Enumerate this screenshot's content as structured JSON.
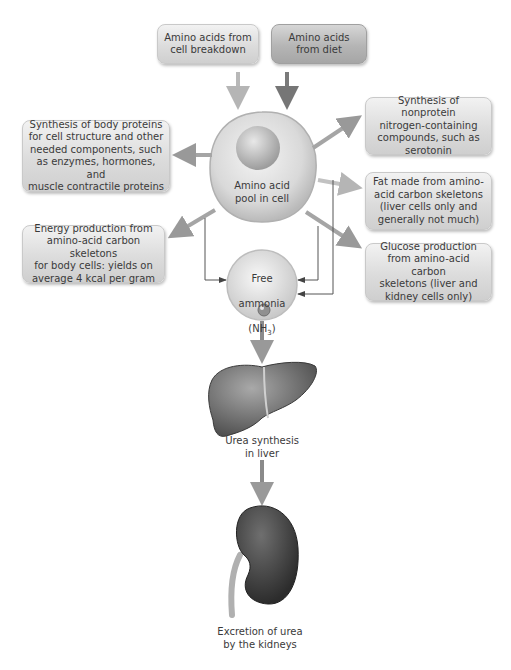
{
  "inputs": [
    {
      "id": "cell-breakdown",
      "text": "Amino acids from\ncell breakdown"
    },
    {
      "id": "diet",
      "text": "Amino acids\nfrom diet"
    }
  ],
  "center": {
    "text": "Amino acid\npool in cell"
  },
  "outputs": {
    "body_proteins": "Synthesis of body proteins\nfor cell structure and other\nneeded components, such\nas enzymes, hormones, and\nmuscle contractile proteins",
    "energy": "Energy production from\namino-acid carbon skeletons\nfor body cells: yields on\naverage 4 kcal per gram",
    "nonprotein": "Synthesis of nonprotein\nnitrogen-containing\ncompounds, such as\nserotonin",
    "fat": "Fat made from amino-\nacid carbon skeletons\n(liver cells only and\ngenerally not much)",
    "glucose": "Glucose production\nfrom amino-acid carbon\nskeletons (liver and\nkidney cells only)"
  },
  "ammonia": {
    "line1": "Free",
    "line2": "ammonia",
    "line3": "(NH",
    "subscript": "3",
    "line3_end": ")"
  },
  "liver": {
    "label": "Urea synthesis\nin liver"
  },
  "kidney": {
    "label": "Excretion of urea\nby the kidneys"
  },
  "colors": {
    "arrow_light": "#b8b8b8",
    "arrow_dark": "#7a7a7a",
    "arrow_mid": "#9a9a9a",
    "thin_line": "#555555"
  }
}
